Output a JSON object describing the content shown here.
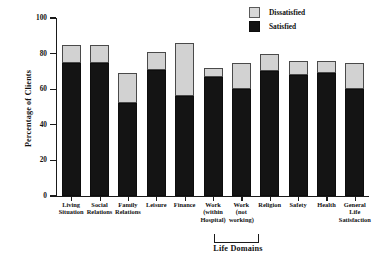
{
  "chart_data": {
    "type": "bar",
    "subtype": "stacked-bar",
    "title": "",
    "xlabel": "Life Domains",
    "ylabel": "Percentage of Clients",
    "ylim": [
      0,
      100
    ],
    "yticks": [
      0,
      20,
      40,
      60,
      80,
      100
    ],
    "ytick_labels": [
      "0",
      "20",
      "40",
      "60",
      "80",
      "100"
    ],
    "grid": false,
    "legend_position": "top-right",
    "categories": [
      "Living Situation",
      "Social Relations",
      "Family Relations",
      "Leisure",
      "Finance",
      "Work (within Hospital)",
      "Work (not working)",
      "Religion",
      "Safety",
      "Health",
      "General Life Satisfaction"
    ],
    "category_lines": [
      [
        "Living",
        "Situation"
      ],
      [
        "Social",
        "Relations"
      ],
      [
        "Family",
        "Relations"
      ],
      [
        "Leisure"
      ],
      [
        "Finance"
      ],
      [
        "Work",
        "(within",
        "Hospital)"
      ],
      [
        "Work",
        "(not",
        "working)"
      ],
      [
        "Religion"
      ],
      [
        "Safety"
      ],
      [
        "Health"
      ],
      [
        "General",
        "Life",
        "Satisfaction"
      ]
    ],
    "series": [
      {
        "name": "Satisfied",
        "color": "#141414",
        "values": [
          75,
          75,
          52,
          71,
          56,
          67,
          60,
          70,
          68,
          69,
          60
        ]
      },
      {
        "name": "Dissatisfied",
        "color": "#d2d2d2",
        "values": [
          10,
          10,
          17,
          10,
          30,
          5,
          15,
          10,
          8,
          7,
          15
        ]
      }
    ],
    "totals": [
      85,
      85,
      69,
      81,
      86,
      72,
      75,
      80,
      76,
      76,
      75
    ],
    "annotations": {
      "work_bracket": "Work categories grouped under Life Domains"
    }
  },
  "legend": {
    "items": [
      {
        "label": "Dissatisfied",
        "swatch": "dissatisfied-swatch"
      },
      {
        "label": "Satisfied",
        "swatch": "satisfied-swatch"
      }
    ]
  }
}
